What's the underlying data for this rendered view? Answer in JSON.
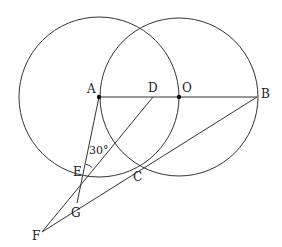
{
  "diagram": {
    "stroke_color": "#333333",
    "circles": [
      {
        "name": "circle-A",
        "center": "A",
        "cx": 99,
        "cy": 97,
        "r": 80
      },
      {
        "name": "circle-O",
        "center": "O",
        "cx": 179,
        "cy": 97,
        "r": 79
      }
    ],
    "points": {
      "A": {
        "label": "A",
        "x": 99,
        "y": 97,
        "lx": 87,
        "ly": 93,
        "dot": true
      },
      "D": {
        "label": "D",
        "x": 153,
        "y": 97,
        "lx": 148,
        "ly": 92,
        "dot": false
      },
      "O": {
        "label": "O",
        "x": 179,
        "y": 97,
        "lx": 182,
        "ly": 92,
        "dot": true
      },
      "B": {
        "label": "B",
        "x": 257,
        "y": 97,
        "lx": 261,
        "ly": 98,
        "dot": false
      },
      "E": {
        "label": "E",
        "x": 83,
        "y": 178,
        "lx": 73,
        "ly": 176,
        "dot": false
      },
      "C": {
        "label": "C",
        "x": 139,
        "y": 167,
        "lx": 133,
        "ly": 181,
        "dot": false
      },
      "G": {
        "label": "G",
        "x": 77,
        "y": 203,
        "lx": 71,
        "ly": 217,
        "dot": false
      },
      "F": {
        "label": "F",
        "x": 42,
        "y": 232,
        "lx": 32,
        "ly": 240,
        "dot": false
      }
    },
    "segments": [
      [
        "A",
        "B"
      ],
      [
        "A",
        "G"
      ],
      [
        "D",
        "F"
      ],
      [
        "B",
        "F"
      ]
    ],
    "angle_label": {
      "text": "30°",
      "x": 89,
      "y": 154
    },
    "angle_arc": {
      "vertex": "E",
      "r": 14
    }
  }
}
